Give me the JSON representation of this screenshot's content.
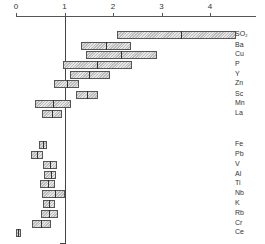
{
  "chart_data": {
    "type": "bar",
    "subtype": "floating-range-with-median",
    "title": "",
    "xlabel": "",
    "ylabel": "",
    "x_ticks": [
      "0",
      "1",
      "2",
      "3",
      "4"
    ],
    "xlim": [
      0,
      4.6
    ],
    "reference_line": 1,
    "grid": false,
    "groups": [
      {
        "name": "upper",
        "categories": [
          "SO2",
          "Ba",
          "Cu",
          "P",
          "Y",
          "Zn",
          "Sc",
          "Mn",
          "La"
        ]
      },
      {
        "name": "lower",
        "categories": [
          "Fe",
          "Pb",
          "V",
          "Al",
          "Ti",
          "Nb",
          "K",
          "Rb",
          "Cr",
          "Ce"
        ]
      }
    ],
    "series": [
      {
        "label": "SO₂",
        "min": 2.09,
        "max": 4.54,
        "median": 3.4
      },
      {
        "label": "Ba",
        "min": 1.33,
        "max": 2.37,
        "median": 1.85
      },
      {
        "label": "Cu",
        "min": 1.44,
        "max": 2.9,
        "median": 2.16
      },
      {
        "label": "P",
        "min": 0.97,
        "max": 2.39,
        "median": 1.67
      },
      {
        "label": "Y",
        "min": 1.11,
        "max": 1.94,
        "median": 1.5
      },
      {
        "label": "Zn",
        "min": 0.78,
        "max": 1.3,
        "median": 1.05
      },
      {
        "label": "Sc",
        "min": 1.24,
        "max": 1.69,
        "median": 1.46
      },
      {
        "label": "Mn",
        "min": 0.39,
        "max": 1.13,
        "median": 0.76
      },
      {
        "label": "La",
        "min": 0.54,
        "max": 0.95,
        "median": 0.74
      },
      {
        "label": "Fe",
        "min": 0.47,
        "max": 0.64,
        "median": 0.56
      },
      {
        "label": "Pb",
        "min": 0.31,
        "max": 0.56,
        "median": 0.43
      },
      {
        "label": "V",
        "min": 0.56,
        "max": 0.85,
        "median": 0.7
      },
      {
        "label": "Al",
        "min": 0.58,
        "max": 0.82,
        "median": 0.72
      },
      {
        "label": "Ti",
        "min": 0.49,
        "max": 0.8,
        "median": 0.66
      },
      {
        "label": "Nb",
        "min": 0.54,
        "max": 1.01,
        "median": 0.8
      },
      {
        "label": "K",
        "min": 0.56,
        "max": 0.8,
        "median": 0.68
      },
      {
        "label": "Rb",
        "min": 0.52,
        "max": 0.87,
        "median": 0.68
      },
      {
        "label": "Cr",
        "min": 0.33,
        "max": 0.72,
        "median": 0.52
      },
      {
        "label": "Ce",
        "min": 0.0,
        "max": 0.1,
        "median": 0.05
      }
    ],
    "row_y": [
      31,
      42,
      51,
      61,
      71,
      80,
      91,
      100,
      110,
      141,
      151,
      161,
      171,
      180,
      190,
      200,
      210,
      220,
      229
    ]
  }
}
